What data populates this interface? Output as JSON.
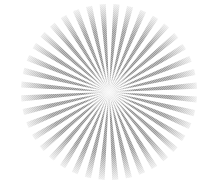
{
  "image": {
    "subject": "radial starburst pattern",
    "center": [
      109,
      92
    ],
    "radius": 88,
    "ray_count": 40,
    "ray_color": "#8c8c8c",
    "background": "#ffffff"
  }
}
